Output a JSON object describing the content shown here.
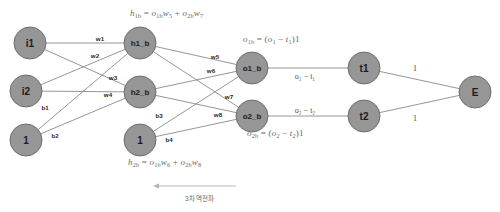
{
  "diagram": {
    "colors": {
      "node_fill": "#969696",
      "node_stroke": "#6e6e6e",
      "edge": "#8a8a8a",
      "background": "#ffffff",
      "formula_text": "#6a6a6a",
      "label_text": "#1f1f1f"
    },
    "nodes": [
      {
        "id": "i1",
        "label": "i1",
        "x": 30,
        "y": 43,
        "r": 16
      },
      {
        "id": "i2",
        "label": "i2",
        "x": 26,
        "y": 91,
        "r": 16
      },
      {
        "id": "bias1",
        "label": "1",
        "x": 26,
        "y": 140,
        "r": 16
      },
      {
        "id": "h1_b",
        "label": "h1_b",
        "x": 140,
        "y": 43,
        "r": 16
      },
      {
        "id": "h2_b",
        "label": "h2_b",
        "x": 140,
        "y": 92,
        "r": 16
      },
      {
        "id": "bias2",
        "label": "1",
        "x": 140,
        "y": 140,
        "r": 16
      },
      {
        "id": "o1_b",
        "label": "o1_b",
        "x": 252,
        "y": 68,
        "r": 16
      },
      {
        "id": "o2_b",
        "label": "o2_b",
        "x": 252,
        "y": 116,
        "r": 16
      },
      {
        "id": "t1",
        "label": "t1",
        "x": 364,
        "y": 68,
        "r": 16
      },
      {
        "id": "t2",
        "label": "t2",
        "x": 364,
        "y": 116,
        "r": 16
      },
      {
        "id": "E",
        "label": "E",
        "x": 475,
        "y": 92,
        "r": 16
      }
    ],
    "edges": [
      {
        "from": "i1",
        "to": "h1_b",
        "label": "w1",
        "lx": 100,
        "ly": 38
      },
      {
        "from": "i1",
        "to": "h2_b",
        "label": "w2",
        "lx": 95,
        "ly": 55
      },
      {
        "from": "i2",
        "to": "h1_b",
        "label": "w3",
        "lx": 113,
        "ly": 77
      },
      {
        "from": "i2",
        "to": "h2_b",
        "label": "w4",
        "lx": 108,
        "ly": 94
      },
      {
        "from": "bias1",
        "to": "h1_b",
        "label": "b1",
        "lx": 45,
        "ly": 107
      },
      {
        "from": "bias1",
        "to": "h2_b",
        "label": "b2",
        "lx": 55,
        "ly": 135
      },
      {
        "from": "h1_b",
        "to": "o1_b",
        "label": "w5",
        "lx": 215,
        "ly": 56
      },
      {
        "from": "h1_b",
        "to": "o2_b",
        "label": "w7",
        "lx": 229,
        "ly": 96
      },
      {
        "from": "h2_b",
        "to": "o1_b",
        "label": "w6",
        "lx": 211,
        "ly": 70
      },
      {
        "from": "h2_b",
        "to": "o2_b",
        "label": "w8",
        "lx": 218,
        "ly": 114
      },
      {
        "from": "bias2",
        "to": "o1_b",
        "label": "b3",
        "lx": 159,
        "ly": 115
      },
      {
        "from": "bias2",
        "to": "o2_b",
        "label": "b4",
        "lx": 169,
        "ly": 139
      }
    ],
    "plain_edges": [
      {
        "from": "o1_b",
        "to": "t1",
        "label": "o₁ − t₁",
        "lx": 305,
        "ly": 76
      },
      {
        "from": "o2_b",
        "to": "t2",
        "label": "o₂ − t₂",
        "lx": 305,
        "ly": 110
      },
      {
        "from": "t1",
        "to": "E",
        "label": "1",
        "lx": 415,
        "ly": 68
      },
      {
        "from": "t2",
        "to": "E",
        "label": "1",
        "lx": 415,
        "ly": 118
      }
    ],
    "formulas": [
      {
        "id": "h1b-formula",
        "x": 130,
        "y": 8,
        "html": "<i>h</i><sub>1b</sub> = <i>o</i><sub>1b</sub><i>w</i><sub>5</sub> + <i>o</i><sub>2b</sub><i>w</i><sub>7</sub>",
        "text": "h1b = o1b w5 + o2b w7"
      },
      {
        "id": "o1b-formula",
        "x": 243,
        "y": 34,
        "html": "<i>o</i><sub>1b</sub> = (<i>o</i><sub>1</sub> − <i>t</i><sub>1</sub>)1",
        "text": "o1b = (o1 - t1)1"
      },
      {
        "id": "o2b-formula",
        "x": 247,
        "y": 128,
        "html": "<i>o</i><sub>2b</sub> = (<i>o</i><sub>2</sub> − <i>t</i><sub>2</sub>)1",
        "text": "o2b = (o2 - t2)1"
      },
      {
        "id": "h2b-formula",
        "x": 128,
        "y": 157,
        "html": "<i>h</i><sub>2b</sub> = <i>o</i><sub>1b</sub><i>w</i><sub>6</sub> + <i>o</i><sub>2b</sub><i>w</i><sub>8</sub>",
        "text": "h2b = o1b w6 + o2b w8"
      }
    ],
    "annotation": {
      "caption": "3차 역전파",
      "caption_x": 185,
      "caption_y": 193,
      "arrow_x1": 236,
      "arrow_x2": 153,
      "arrow_y": 186
    }
  }
}
